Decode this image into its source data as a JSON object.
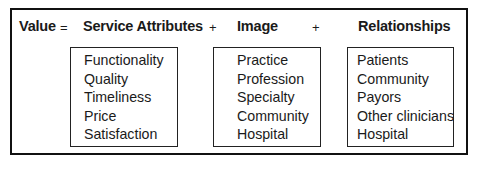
{
  "equation": {
    "lhs": "Value",
    "equals": "=",
    "plus": "+"
  },
  "components": [
    {
      "title": "Service Attributes",
      "items": [
        "Functionality",
        "Quality",
        "Timeliness",
        "Price",
        "Satisfaction"
      ]
    },
    {
      "title": "Image",
      "items": [
        "Practice",
        "Profession",
        "Specialty",
        "Community",
        "Hospital"
      ]
    },
    {
      "title": "Relationships",
      "items": [
        "Patients",
        "Community",
        "Payors",
        "Other clinicians",
        "Hospital"
      ]
    }
  ]
}
